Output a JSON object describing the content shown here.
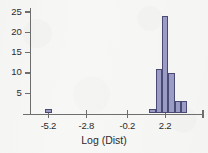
{
  "chart_data": {
    "type": "bar",
    "title": "",
    "subtitle": "",
    "xlabel": "Log (Dist)",
    "ylabel": "",
    "grid": false,
    "legend": null,
    "xlim": [
      -6.4,
      4.6
    ],
    "ylim": [
      0,
      26
    ],
    "x_ticks": [
      -5.2,
      -2.8,
      -0.2,
      2.2,
      4.6
    ],
    "x_tick_labels": [
      "-5.2",
      "-2.8",
      "-0.2",
      "2.2",
      ""
    ],
    "y_ticks": [
      5,
      10,
      15,
      20,
      25
    ],
    "y_tick_labels": [
      "5",
      "10",
      "15",
      "20",
      "25"
    ],
    "bin_width": 0.4,
    "bars": [
      {
        "x_left": -5.4,
        "x_right": -5.0,
        "value": 1
      },
      {
        "x_left": 1.2,
        "x_right": 1.6,
        "value": 1
      },
      {
        "x_left": 1.6,
        "x_right": 2.0,
        "value": 11
      },
      {
        "x_left": 2.0,
        "x_right": 2.4,
        "value": 24
      },
      {
        "x_left": 2.4,
        "x_right": 2.8,
        "value": 10
      },
      {
        "x_left": 2.8,
        "x_right": 3.2,
        "value": 3
      },
      {
        "x_left": 3.2,
        "x_right": 3.6,
        "value": 3
      }
    ],
    "categories": [
      "-5.2",
      "1.4",
      "1.8",
      "2.2",
      "2.6",
      "3.0",
      "3.4"
    ],
    "values": [
      1,
      1,
      11,
      24,
      10,
      3,
      3
    ],
    "colors": {
      "bar_fill": "#9b9cc6",
      "bar_edge": "#4a4a74",
      "axis": "#6e6e6e",
      "text": "#2b2b2b",
      "background": "#f7f7f5"
    }
  }
}
